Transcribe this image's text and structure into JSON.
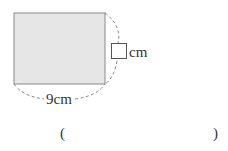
{
  "figure": {
    "rectangle": {
      "fill": "#e6e6e6",
      "stroke": "#8a8a8a"
    },
    "width_label": "9cm",
    "height_label_unit": "cm",
    "height_value": ""
  },
  "answer": {
    "open_paren": "(",
    "close_paren": ")",
    "value": ""
  }
}
